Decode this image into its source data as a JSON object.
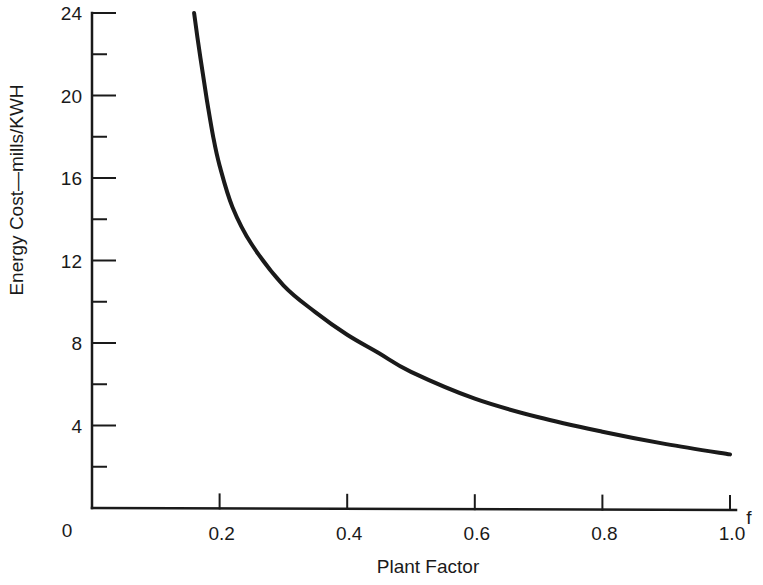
{
  "chart_data": {
    "type": "line",
    "title": "",
    "xlabel": "Plant Factor",
    "ylabel": "Energy Cost—mills/KWH",
    "x_axis_symbol": "f",
    "xlim": [
      0,
      1.0
    ],
    "ylim": [
      0,
      24
    ],
    "x_ticks": [
      0.2,
      0.4,
      0.6,
      0.8,
      1.0
    ],
    "x_tick_labels": [
      "0.2",
      "0.4",
      "0.6",
      "0.8",
      "1.0"
    ],
    "y_ticks": [
      4,
      8,
      12,
      16,
      20,
      24
    ],
    "y_tick_labels": [
      "4",
      "8",
      "12",
      "16",
      "20",
      "24"
    ],
    "y_minor_ticks": [
      2,
      6,
      10,
      14,
      18,
      22
    ],
    "origin_label": "0",
    "grid": false,
    "legend": null,
    "series": [
      {
        "name": "Energy cost vs plant factor",
        "color": "#1a1a1a",
        "x": [
          0.16,
          0.17,
          0.18,
          0.19,
          0.2,
          0.22,
          0.25,
          0.3,
          0.35,
          0.4,
          0.45,
          0.5,
          0.6,
          0.7,
          0.8,
          0.9,
          1.0
        ],
        "y": [
          24.0,
          21.8,
          19.8,
          18.0,
          16.6,
          14.6,
          12.8,
          10.8,
          9.5,
          8.4,
          7.5,
          6.6,
          5.3,
          4.4,
          3.7,
          3.1,
          2.6
        ]
      }
    ]
  },
  "plot_geometry": {
    "x0_px": 92,
    "x1_px": 730,
    "y0_px": 508,
    "y24_px": 13
  }
}
